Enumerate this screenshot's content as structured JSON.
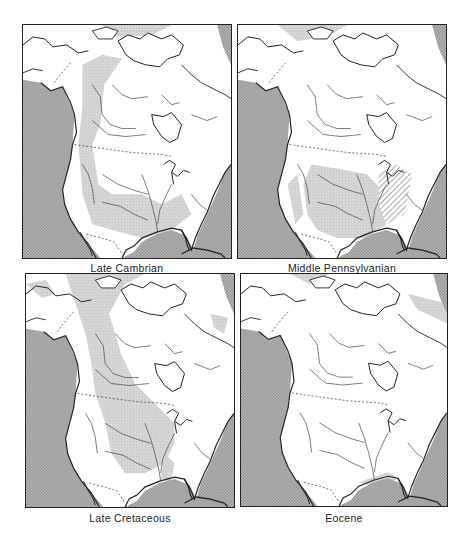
{
  "figure": {
    "panels": [
      {
        "id": "late-cambrian",
        "label": "Late Cambrian",
        "hatched_swamps": false
      },
      {
        "id": "middle-pennsylvanian",
        "label": "Middle Pennsylvanian",
        "hatched_swamps": true
      },
      {
        "id": "late-cretaceous",
        "label": "Late Cretaceous",
        "hatched_swamps": false
      },
      {
        "id": "eocene",
        "label": "Eocene",
        "hatched_swamps": false
      }
    ],
    "legend_colors": {
      "deep_ocean": "#a9a9a9",
      "shallow_sea": "#d3d3d3",
      "land": "#ffffff",
      "outline": "#222222"
    }
  }
}
